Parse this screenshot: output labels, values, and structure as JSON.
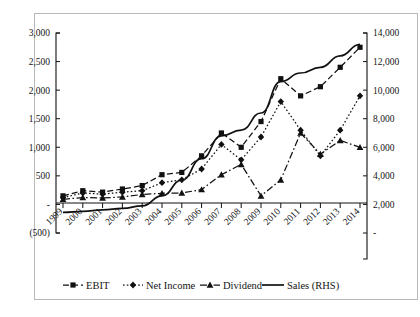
{
  "chart_data": {
    "type": "line",
    "title": "",
    "xlabel": "",
    "ylabel": "",
    "grid": false,
    "legend_position": "bottom",
    "categories": [
      "1999",
      "2000",
      "2001",
      "2002",
      "2003",
      "2004",
      "2005",
      "2006",
      "2007",
      "2008",
      "2009",
      "2010",
      "2011",
      "2012",
      "2013",
      "2014"
    ],
    "axes": {
      "left": {
        "name": "primary",
        "ylim": [
          -500,
          3000
        ],
        "tick_values": [
          -500,
          0,
          500,
          1000,
          1500,
          2000,
          2500,
          3000
        ],
        "tick_labels": [
          "(500)",
          "-",
          "500",
          "1,000",
          "1,500",
          "2,000",
          "2,500",
          "3,000"
        ]
      },
      "right": {
        "name": "secondary",
        "ylim": [
          0,
          14000
        ],
        "tick_values": [
          0,
          2000,
          4000,
          6000,
          8000,
          10000,
          12000,
          14000
        ],
        "tick_labels": [
          "-",
          "2,000",
          "4,000",
          "6,000",
          "8,000",
          "10,000",
          "12,000",
          "14,000"
        ]
      }
    },
    "series": [
      {
        "name": "EBIT",
        "axis": "left",
        "marker": "square",
        "line_style": "dashed",
        "values": [
          150,
          240,
          215,
          270,
          330,
          520,
          560,
          850,
          1250,
          1000,
          1450,
          2200,
          1900,
          2060,
          2400,
          2750
        ]
      },
      {
        "name": "Net Income",
        "axis": "left",
        "marker": "diamond",
        "line_style": "dotted",
        "values": [
          120,
          200,
          180,
          215,
          240,
          380,
          430,
          620,
          1050,
          780,
          1180,
          1800,
          1300,
          850,
          1300,
          1900
        ]
      },
      {
        "name": "Dividend",
        "axis": "left",
        "marker": "triangle",
        "line_style": "dash-dot",
        "values": [
          90,
          120,
          115,
          130,
          175,
          195,
          200,
          260,
          520,
          700,
          150,
          430,
          1250,
          880,
          1120,
          1000
        ]
      },
      {
        "name": "Sales (RHS)",
        "axis": "right",
        "marker": "none",
        "line_style": "solid",
        "values": [
          1450,
          1520,
          1620,
          1720,
          1900,
          2600,
          3700,
          5200,
          6800,
          7200,
          8400,
          10600,
          11200,
          11600,
          12400,
          13200
        ]
      }
    ],
    "legend": [
      {
        "label": "EBIT",
        "style": "dashed-square"
      },
      {
        "label": "Net Income",
        "style": "dotted-diamond"
      },
      {
        "label": "Dividend",
        "style": "dashdot-triangle"
      },
      {
        "label": "Sales (RHS)",
        "style": "solid-line"
      }
    ]
  }
}
